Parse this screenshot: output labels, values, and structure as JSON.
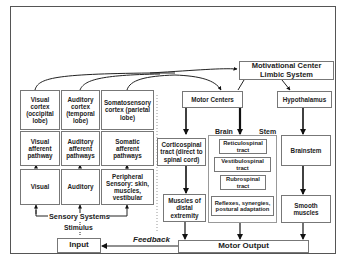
{
  "diagram": {
    "nodes": {
      "motivational_center": "Motivational Center\nLimbic System",
      "motor_centers": "Motor Centers",
      "hypothalamus": "Hypothalamus",
      "visual_cortex": "Visual cortex (occipital lobe)",
      "auditory_cortex": "Auditory cortex (temporal lobe)",
      "somatosensory_cortex": "Somatosensory cortex (parietal lobe)",
      "visual_afferent": "Visual afferent pathway",
      "auditory_afferent": "Auditory afferent pathways",
      "somatic_afferent": "Somatic afferent pathways",
      "visual": "Visual",
      "auditory": "Auditory",
      "peripheral_sensory": "Peripheral Sensory: skin, muscles, vestibular",
      "corticospinal": "Corticospinal tract (direct to spinal cord)",
      "reticulospinal": "Reticulospinal tract",
      "vestibulospinal": "Vestibulospinal tract",
      "rubrospinal": "Rubrospinal tract",
      "reflexes": "Reflexes, synergies, postural adaptation",
      "brainstem": "Brainstem",
      "muscles_distal": "Muscles of distal extremity",
      "smooth_muscles": "Smooth muscles",
      "motor_output": "Motor Output",
      "input": "Input"
    },
    "labels": {
      "brain": "Brain",
      "stem": "Stem",
      "sensory_systems": "Sensory Systems",
      "stimulus": "Stimulus",
      "feedback": "Feedback"
    }
  }
}
